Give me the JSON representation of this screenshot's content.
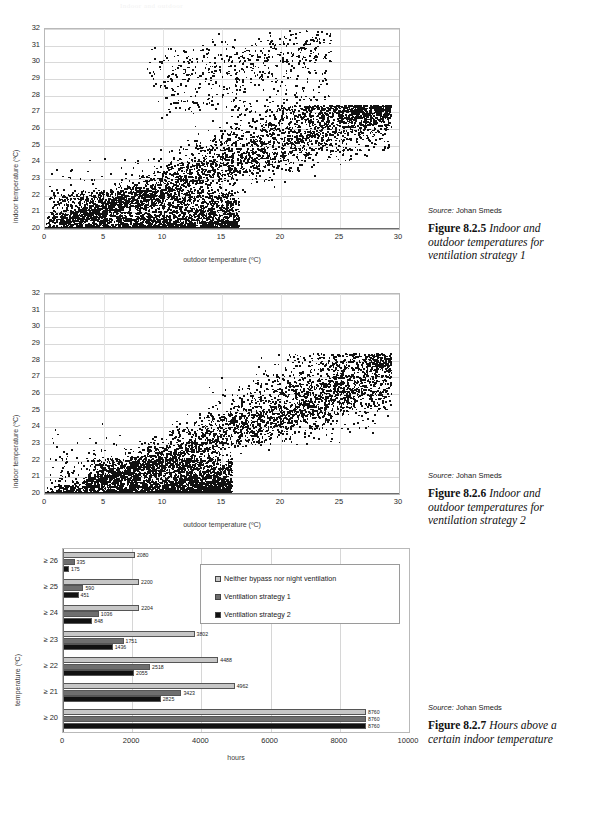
{
  "page": {
    "faint_header": "Indoor and outdoor"
  },
  "figures": [
    {
      "id": "figure-825",
      "source_prefix": "Source:",
      "source_name": "Johan Smeds",
      "caption_number": "Figure 8.2.5",
      "caption_text": " Indoor and outdoor temperatures for ventilation strategy 1"
    },
    {
      "id": "figure-826",
      "source_prefix": "Source:",
      "source_name": "Johan Smeds",
      "caption_number": "Figure 8.2.6",
      "caption_text": " Indoor and outdoor temperatures for ventilation strategy 2"
    },
    {
      "id": "figure-827",
      "source_prefix": "Source:",
      "source_name": "Johan Smeds",
      "caption_number": "Figure 8.2.7",
      "caption_text": " Hours above a certain indoor temperature"
    }
  ],
  "chart_data": [
    {
      "type": "scatter",
      "id": "scatter-strategy-1",
      "title": "",
      "xlabel": "outdoor temperature (ºC)",
      "ylabel": "indoor temperature (ºC)",
      "xlim": [
        0,
        30
      ],
      "ylim": [
        20,
        32
      ],
      "xticks": [
        0,
        5,
        10,
        15,
        20,
        25,
        30
      ],
      "yticks": [
        20,
        21,
        22,
        23,
        24,
        25,
        26,
        27,
        28,
        29,
        30,
        31,
        32
      ],
      "grid": true,
      "legend": "none",
      "marker_color": "#111111",
      "point_count_approx": 8760,
      "description": "Dense cloud rising from (0,20) to about (29,27); upper scattered branch reaching 29-32 C between 9 and 24 C outdoor; solid saturated band along indoor 20 C from 0 to 16 C outdoor."
    },
    {
      "type": "scatter",
      "id": "scatter-strategy-2",
      "title": "",
      "xlabel": "outdoor temperature (ºC)",
      "ylabel": "indoor temperature (ºC)",
      "xlim": [
        0,
        30
      ],
      "ylim": [
        20,
        32
      ],
      "xticks": [
        0,
        5,
        10,
        15,
        20,
        25,
        30
      ],
      "yticks": [
        20,
        21,
        22,
        23,
        24,
        25,
        26,
        27,
        28,
        29,
        30,
        31,
        32
      ],
      "grid": true,
      "legend": "none",
      "marker_color": "#111111",
      "point_count_approx": 8760,
      "description": "Cloud rising from (3,20) to about (29,27), maximum indoor temperature near 28.4 C; solid saturated band along indoor 20 C from 0 to 15.5 C outdoor; no high branch above 29 C."
    },
    {
      "type": "bar",
      "id": "hours-above-temperature",
      "orientation": "horizontal",
      "title": "",
      "xlabel": "hours",
      "ylabel": "temperature (ºC)",
      "xlim": [
        0,
        10000
      ],
      "xticks": [
        0,
        2000,
        4000,
        6000,
        8000,
        10000
      ],
      "categories": [
        "≥ 26",
        "≥ 25",
        "≥ 24",
        "≥ 23",
        "≥ 22",
        "≥ 21",
        "≥ 20"
      ],
      "grid": true,
      "legend_position": "upper-right-inside",
      "series": [
        {
          "name": "Neither bypass nor night ventilation",
          "color": "#c6c6c6",
          "values": [
            2080,
            2200,
            2204,
            3802,
            4488,
            4962,
            8760
          ]
        },
        {
          "name": "Ventilation strategy 1",
          "color": "#6e6e6e",
          "values": [
            335,
            590,
            1036,
            1751,
            2518,
            3423,
            8760
          ]
        },
        {
          "name": "Ventilation strategy 2",
          "color": "#111111",
          "values": [
            175,
            451,
            848,
            1436,
            2055,
            2825,
            8760
          ]
        }
      ]
    }
  ]
}
